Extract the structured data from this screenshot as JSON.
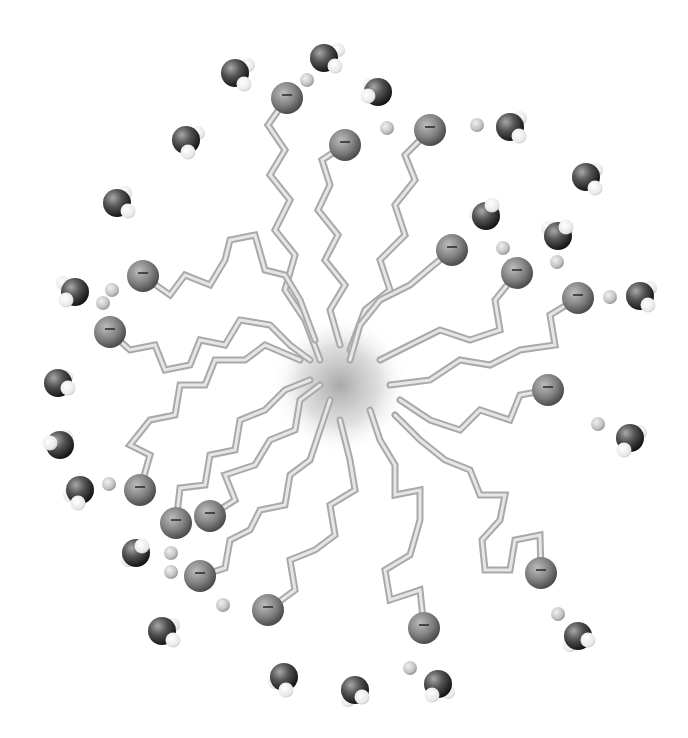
{
  "diagram": {
    "colors": {
      "background": "#ffffff",
      "tail": "#a9a9a9",
      "tail_highlight": "#e6e6e6",
      "head": "#7a7a7a",
      "counterion": "#c8c8c8",
      "water_oxygen": "#3a3a3a",
      "water_hydrogen": "#f2f2f2",
      "core_shade": "#9a9a9a"
    },
    "head_symbol": "−",
    "core": {
      "cx": 340,
      "cy": 385,
      "r": 70
    },
    "surfactants": [
      {
        "head": [
          287,
          98
        ],
        "tail": [
          [
            287,
            98
          ],
          [
            268,
            125
          ],
          [
            285,
            150
          ],
          [
            270,
            175
          ],
          [
            290,
            200
          ],
          [
            275,
            230
          ],
          [
            295,
            255
          ],
          [
            285,
            290
          ],
          [
            305,
            320
          ],
          [
            320,
            360
          ]
        ]
      },
      {
        "head": [
          345,
          145
        ],
        "tail": [
          [
            345,
            145
          ],
          [
            322,
            160
          ],
          [
            330,
            185
          ],
          [
            318,
            210
          ],
          [
            338,
            235
          ],
          [
            325,
            260
          ],
          [
            345,
            285
          ],
          [
            330,
            310
          ],
          [
            340,
            345
          ]
        ]
      },
      {
        "head": [
          430,
          130
        ],
        "tail": [
          [
            430,
            130
          ],
          [
            405,
            155
          ],
          [
            415,
            180
          ],
          [
            395,
            205
          ],
          [
            405,
            235
          ],
          [
            380,
            260
          ],
          [
            390,
            290
          ],
          [
            365,
            310
          ],
          [
            350,
            350
          ]
        ]
      },
      {
        "head": [
          452,
          250
        ],
        "tail": [
          [
            452,
            250
          ],
          [
            430,
            268
          ],
          [
            410,
            285
          ],
          [
            380,
            300
          ],
          [
            360,
            325
          ],
          [
            350,
            360
          ]
        ]
      },
      {
        "head": [
          517,
          273
        ],
        "tail": [
          [
            517,
            273
          ],
          [
            495,
            300
          ],
          [
            500,
            330
          ],
          [
            470,
            340
          ],
          [
            440,
            330
          ],
          [
            410,
            345
          ],
          [
            380,
            360
          ]
        ]
      },
      {
        "head": [
          578,
          298
        ],
        "tail": [
          [
            578,
            298
          ],
          [
            550,
            315
          ],
          [
            555,
            345
          ],
          [
            520,
            350
          ],
          [
            490,
            365
          ],
          [
            460,
            360
          ],
          [
            430,
            380
          ],
          [
            390,
            385
          ]
        ]
      },
      {
        "head": [
          548,
          390
        ],
        "tail": [
          [
            548,
            390
          ],
          [
            520,
            395
          ],
          [
            510,
            420
          ],
          [
            480,
            410
          ],
          [
            460,
            430
          ],
          [
            430,
            420
          ],
          [
            400,
            400
          ]
        ]
      },
      {
        "head": [
          541,
          573
        ],
        "tail": [
          [
            541,
            573
          ],
          [
            540,
            535
          ],
          [
            515,
            540
          ],
          [
            510,
            570
          ],
          [
            485,
            570
          ],
          [
            482,
            540
          ],
          [
            500,
            520
          ],
          [
            505,
            495
          ],
          [
            480,
            495
          ],
          [
            470,
            470
          ],
          [
            445,
            460
          ],
          [
            420,
            440
          ],
          [
            395,
            415
          ]
        ]
      },
      {
        "head": [
          424,
          628
        ],
        "tail": [
          [
            424,
            628
          ],
          [
            420,
            590
          ],
          [
            390,
            600
          ],
          [
            385,
            570
          ],
          [
            410,
            555
          ],
          [
            420,
            520
          ],
          [
            420,
            490
          ],
          [
            395,
            495
          ],
          [
            395,
            465
          ],
          [
            380,
            440
          ],
          [
            370,
            410
          ]
        ]
      },
      {
        "head": [
          268,
          610
        ],
        "tail": [
          [
            268,
            610
          ],
          [
            295,
            590
          ],
          [
            290,
            560
          ],
          [
            315,
            550
          ],
          [
            335,
            535
          ],
          [
            330,
            505
          ],
          [
            355,
            490
          ],
          [
            350,
            460
          ],
          [
            340,
            420
          ]
        ]
      },
      {
        "head": [
          200,
          576
        ],
        "tail": [
          [
            200,
            576
          ],
          [
            225,
            568
          ],
          [
            230,
            540
          ],
          [
            250,
            530
          ],
          [
            260,
            510
          ],
          [
            285,
            505
          ],
          [
            290,
            475
          ],
          [
            310,
            460
          ],
          [
            320,
            430
          ],
          [
            330,
            400
          ]
        ]
      },
      {
        "head": [
          210,
          516
        ],
        "tail": [
          [
            210,
            516
          ],
          [
            235,
            500
          ],
          [
            225,
            475
          ],
          [
            255,
            465
          ],
          [
            270,
            440
          ],
          [
            295,
            430
          ],
          [
            300,
            400
          ],
          [
            320,
            385
          ]
        ]
      },
      {
        "head": [
          176,
          523
        ],
        "tail": [
          [
            176,
            523
          ],
          [
            180,
            488
          ],
          [
            205,
            485
          ],
          [
            210,
            455
          ],
          [
            235,
            450
          ],
          [
            240,
            420
          ],
          [
            265,
            410
          ],
          [
            285,
            390
          ],
          [
            310,
            380
          ]
        ]
      },
      {
        "head": [
          140,
          490
        ],
        "tail": [
          [
            140,
            490
          ],
          [
            150,
            455
          ],
          [
            130,
            445
          ],
          [
            150,
            420
          ],
          [
            175,
            415
          ],
          [
            180,
            385
          ],
          [
            205,
            385
          ],
          [
            215,
            360
          ],
          [
            245,
            360
          ],
          [
            265,
            345
          ],
          [
            300,
            360
          ]
        ]
      },
      {
        "head": [
          110,
          332
        ],
        "tail": [
          [
            110,
            332
          ],
          [
            130,
            350
          ],
          [
            155,
            345
          ],
          [
            165,
            370
          ],
          [
            190,
            365
          ],
          [
            200,
            340
          ],
          [
            225,
            345
          ],
          [
            240,
            320
          ],
          [
            270,
            325
          ],
          [
            290,
            345
          ],
          [
            310,
            360
          ]
        ]
      },
      {
        "head": [
          143,
          276
        ],
        "tail": [
          [
            143,
            276
          ],
          [
            170,
            295
          ],
          [
            185,
            275
          ],
          [
            210,
            285
          ],
          [
            225,
            260
          ],
          [
            230,
            240
          ],
          [
            255,
            235
          ],
          [
            265,
            270
          ],
          [
            285,
            275
          ],
          [
            300,
            300
          ],
          [
            315,
            340
          ]
        ]
      }
    ],
    "counterions": [
      [
        307,
        80
      ],
      [
        387,
        128
      ],
      [
        477,
        125
      ],
      [
        503,
        248
      ],
      [
        557,
        262
      ],
      [
        610,
        297
      ],
      [
        112,
        290
      ],
      [
        103,
        303
      ],
      [
        109,
        484
      ],
      [
        171,
        553
      ],
      [
        171,
        572
      ],
      [
        223,
        605
      ],
      [
        598,
        424
      ],
      [
        558,
        614
      ],
      [
        410,
        668
      ]
    ],
    "waters": [
      {
        "o": [
          235,
          73
        ],
        "h": [
          [
            248,
            65
          ],
          [
            244,
            84
          ]
        ]
      },
      {
        "o": [
          324,
          58
        ],
        "h": [
          [
            338,
            50
          ],
          [
            335,
            66
          ]
        ]
      },
      {
        "o": [
          378,
          92
        ],
        "h": [
          [
            370,
            85
          ],
          [
            368,
            96
          ]
        ]
      },
      {
        "o": [
          510,
          127
        ],
        "h": [
          [
            520,
            118
          ],
          [
            519,
            136
          ]
        ]
      },
      {
        "o": [
          186,
          140
        ],
        "h": [
          [
            198,
            133
          ],
          [
            188,
            152
          ]
        ]
      },
      {
        "o": [
          117,
          203
        ],
        "h": [
          [
            125,
            193
          ],
          [
            128,
            211
          ]
        ]
      },
      {
        "o": [
          586,
          177
        ],
        "h": [
          [
            596,
            170
          ],
          [
            595,
            188
          ]
        ]
      },
      {
        "o": [
          486,
          216
        ],
        "h": [
          [
            476,
            214
          ],
          [
            492,
            205
          ]
        ]
      },
      {
        "o": [
          558,
          236
        ],
        "h": [
          [
            548,
            228
          ],
          [
            566,
            227
          ]
        ]
      },
      {
        "o": [
          640,
          296
        ],
        "h": [
          [
            650,
            288
          ],
          [
            648,
            305
          ]
        ]
      },
      {
        "o": [
          75,
          292
        ],
        "h": [
          [
            63,
            283
          ],
          [
            66,
            300
          ]
        ]
      },
      {
        "o": [
          58,
          383
        ],
        "h": [
          [
            66,
            377
          ],
          [
            68,
            388
          ]
        ]
      },
      {
        "o": [
          60,
          445
        ],
        "h": [
          [
            66,
            437
          ],
          [
            50,
            443
          ]
        ]
      },
      {
        "o": [
          80,
          490
        ],
        "h": [
          [
            70,
            495
          ],
          [
            78,
            503
          ]
        ]
      },
      {
        "o": [
          630,
          438
        ],
        "h": [
          [
            640,
            432
          ],
          [
            624,
            450
          ]
        ]
      },
      {
        "o": [
          136,
          553
        ],
        "h": [
          [
            128,
            560
          ],
          [
            142,
            546
          ]
        ]
      },
      {
        "o": [
          162,
          631
        ],
        "h": [
          [
            173,
            625
          ],
          [
            173,
            640
          ]
        ]
      },
      {
        "o": [
          578,
          636
        ],
        "h": [
          [
            570,
            645
          ],
          [
            588,
            640
          ]
        ]
      },
      {
        "o": [
          284,
          677
        ],
        "h": [
          [
            275,
            682
          ],
          [
            286,
            690
          ]
        ]
      },
      {
        "o": [
          355,
          690
        ],
        "h": [
          [
            348,
            700
          ],
          [
            362,
            697
          ]
        ]
      },
      {
        "o": [
          438,
          684
        ],
        "h": [
          [
            448,
            692
          ],
          [
            432,
            695
          ]
        ]
      }
    ]
  }
}
